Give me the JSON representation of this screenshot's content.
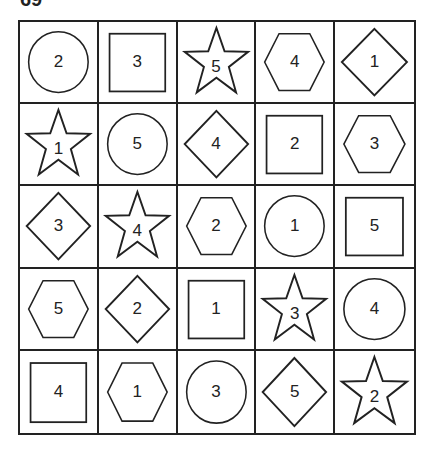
{
  "puzzle": {
    "label": "69",
    "rows": 5,
    "cols": 5,
    "cells": [
      [
        {
          "shape": "circle",
          "number": "2"
        },
        {
          "shape": "square",
          "number": "3"
        },
        {
          "shape": "star",
          "number": "5"
        },
        {
          "shape": "hexagon",
          "number": "4"
        },
        {
          "shape": "diamond",
          "number": "1"
        }
      ],
      [
        {
          "shape": "star",
          "number": "1"
        },
        {
          "shape": "circle",
          "number": "5"
        },
        {
          "shape": "diamond",
          "number": "4"
        },
        {
          "shape": "square",
          "number": "2"
        },
        {
          "shape": "hexagon",
          "number": "3"
        }
      ],
      [
        {
          "shape": "diamond",
          "number": "3"
        },
        {
          "shape": "star",
          "number": "4"
        },
        {
          "shape": "hexagon",
          "number": "2"
        },
        {
          "shape": "circle",
          "number": "1"
        },
        {
          "shape": "square",
          "number": "5"
        }
      ],
      [
        {
          "shape": "hexagon",
          "number": "5"
        },
        {
          "shape": "diamond",
          "number": "2"
        },
        {
          "shape": "square",
          "number": "1"
        },
        {
          "shape": "star",
          "number": "3"
        },
        {
          "shape": "circle",
          "number": "4"
        }
      ],
      [
        {
          "shape": "square",
          "number": "4"
        },
        {
          "shape": "hexagon",
          "number": "1"
        },
        {
          "shape": "circle",
          "number": "3"
        },
        {
          "shape": "diamond",
          "number": "5"
        },
        {
          "shape": "star",
          "number": "2"
        }
      ]
    ]
  },
  "colors": {
    "line": "#222222",
    "background": "#ffffff"
  }
}
